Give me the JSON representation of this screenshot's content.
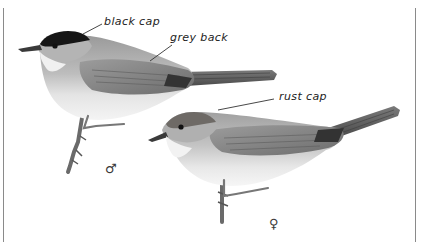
{
  "figure": {
    "colors": {
      "background": "#ffffff",
      "frame": "#8a8a8a",
      "ink": "#222222",
      "male_cap": "#161616",
      "female_cap": "#6e6a66",
      "grey_back": "#8c8c8c",
      "underparts": "#e6e6e6",
      "tail": "#5a5a5a",
      "perch": "#6a6a6a"
    },
    "labels": {
      "black_cap": "black cap",
      "grey_back": "grey back",
      "rust_cap": "rust cap"
    },
    "symbols": {
      "male": "♂",
      "female": "♀"
    }
  }
}
